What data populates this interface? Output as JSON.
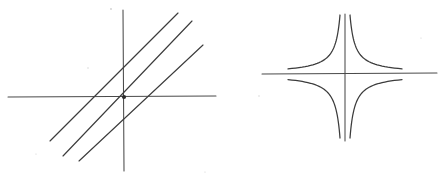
{
  "page": {
    "width": 438,
    "height": 180,
    "background_color": "#ffffff",
    "ink_color": "#3c3c3c",
    "axis_color": "#4a4a4a"
  },
  "figures": [
    {
      "id": "left-figure",
      "name": "family-of-lines-through-origin",
      "kind": "line-pencil",
      "axes": {
        "origin": [
          124,
          97
        ],
        "x_axis": {
          "x1": 8,
          "y1": 97,
          "x2": 216,
          "y2": 96
        },
        "y_axis": {
          "x1": 123,
          "y1": 10,
          "x2": 124,
          "y2": 171
        }
      },
      "lines": [
        {
          "name": "steepest-line",
          "slope_label": "steep",
          "x1": 50,
          "y1": 141,
          "x2": 178,
          "y2": 13
        },
        {
          "name": "middle-line",
          "slope_label": "medium",
          "x1": 63,
          "y1": 156,
          "x2": 192,
          "y2": 21
        },
        {
          "name": "shallowest-line",
          "slope_label": "shallow",
          "x1": 79,
          "y1": 161,
          "x2": 203,
          "y2": 45
        }
      ],
      "origin_marker": {
        "cx": 124,
        "cy": 97,
        "r": 2.1
      }
    },
    {
      "id": "right-figure",
      "name": "rectangular-hyperbola-four-branches",
      "kind": "hyperbola",
      "axes": {
        "origin": [
          345,
          74
        ],
        "x_axis": {
          "x1": 262,
          "y1": 74,
          "x2": 437,
          "y2": 73
        },
        "y_axis": {
          "x1": 345,
          "y1": 14,
          "x2": 345,
          "y2": 141
        }
      },
      "branches": [
        {
          "name": "branch-quadrant-I",
          "quadrant": "I",
          "near_vertical_at": [
            350,
            15
          ],
          "near_horizontal_at": [
            402,
            71
          ]
        },
        {
          "name": "branch-quadrant-II",
          "quadrant": "II",
          "near_vertical_at": [
            340,
            15
          ],
          "near_horizontal_at": [
            288,
            71
          ]
        },
        {
          "name": "branch-quadrant-III",
          "quadrant": "III",
          "near_vertical_at": [
            340,
            138
          ],
          "near_horizontal_at": [
            288,
            79
          ]
        },
        {
          "name": "branch-quadrant-IV",
          "quadrant": "IV",
          "near_vertical_at": [
            350,
            138
          ],
          "near_horizontal_at": [
            402,
            79
          ]
        }
      ]
    }
  ],
  "specks": [
    {
      "cx": 111,
      "cy": 9,
      "r": 0.9
    },
    {
      "cx": 88,
      "cy": 68,
      "r": 0.7
    },
    {
      "cx": 36,
      "cy": 154,
      "r": 0.6
    },
    {
      "cx": 259,
      "cy": 96,
      "r": 0.7
    },
    {
      "cx": 421,
      "cy": 38,
      "r": 0.6
    },
    {
      "cx": 205,
      "cy": 172,
      "r": 0.6
    }
  ],
  "labels": {
    "left_caption": "",
    "right_caption": ""
  }
}
